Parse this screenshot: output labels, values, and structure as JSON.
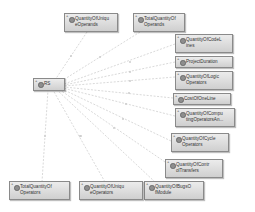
{
  "diagram": {
    "type": "dependency-graph",
    "root": {
      "id": "rs",
      "label": "RS"
    },
    "nodes": [
      {
        "id": "n1",
        "label": "QuantityOfUniqueOperands",
        "line1": "QuantityOfUniqu",
        "line2": "eOperands"
      },
      {
        "id": "n2",
        "label": "TotalQuantityOfOperands",
        "line1": "TotalQuantityOf",
        "line2": "Operands"
      },
      {
        "id": "n3",
        "label": "QuantityOfCodeLines",
        "line1": "QuantityOfCodeL",
        "line2": "ines"
      },
      {
        "id": "n4",
        "label": "ProjectDuration",
        "line1": "ProjectDuration",
        "line2": ""
      },
      {
        "id": "n5",
        "label": "QuantityOfLogicOperators",
        "line1": "QuantityOfLogic",
        "line2": "Operators"
      },
      {
        "id": "n6",
        "label": "CostOfOneLine",
        "line1": "CostOfOneLine",
        "line2": ""
      },
      {
        "id": "n7",
        "label": "QuantityOfComputingOperatorsAn...",
        "line1": "QuantityOfCompu",
        "line2": "tingOperatorsAn..."
      },
      {
        "id": "n8",
        "label": "QuantityOfCycleOperators",
        "line1": "QuantityOfCycle",
        "line2": "Operators"
      },
      {
        "id": "n9",
        "label": "QuantityOfControlTransfers",
        "line1": "QuantityOfContr",
        "line2": "olTransfers"
      },
      {
        "id": "n10",
        "label": "QuantityOfBugsOfModule",
        "line1": "QuantityOfBugsO",
        "line2": "fModule"
      },
      {
        "id": "n11",
        "label": "QuantityOfUniqueOperators",
        "line1": "QuantityOfUniqu",
        "line2": "eOperators"
      },
      {
        "id": "n12",
        "label": "TotalQuantityOfOperators",
        "line1": "TotalQuantityOf",
        "line2": "Operators"
      }
    ],
    "edges": [
      {
        "from": "n1",
        "to": "rs"
      },
      {
        "from": "n2",
        "to": "rs"
      },
      {
        "from": "n3",
        "to": "rs"
      },
      {
        "from": "n4",
        "to": "rs"
      },
      {
        "from": "n5",
        "to": "rs"
      },
      {
        "from": "n6",
        "to": "rs"
      },
      {
        "from": "n7",
        "to": "rs"
      },
      {
        "from": "n8",
        "to": "rs"
      },
      {
        "from": "n9",
        "to": "rs"
      },
      {
        "from": "n10",
        "to": "rs"
      },
      {
        "from": "n11",
        "to": "rs"
      },
      {
        "from": "n12",
        "to": "rs"
      }
    ],
    "colors": {
      "node_fill": "#dcdcdc",
      "node_border": "#8a8a8a",
      "edge": "#c8c8c8",
      "background": "#ffffff"
    }
  }
}
